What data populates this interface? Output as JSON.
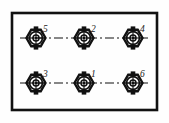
{
  "figure": {
    "type": "engineering-drawing",
    "background_color": "#fefefe",
    "line_color": "#111111",
    "frame": {
      "x": 12,
      "y": 13,
      "width": 145,
      "height": 97,
      "stroke_width": 2.6
    },
    "centerlines": {
      "style": "dash-dot",
      "rows_y": [
        38,
        83
      ],
      "x_start": 20,
      "x_end": 150
    },
    "symbol": {
      "name": "bolt-head-symbol",
      "outer_shape": "hexagon",
      "outer_radius": 9.5,
      "circle_radii": [
        6.5,
        3.2,
        1.4
      ],
      "tab_width": 4.5,
      "tab_height": 2.6
    },
    "bolts": [
      {
        "id": "bolt-5",
        "label": "5",
        "cx": 36,
        "cy": 38,
        "label_dx": 7,
        "label_dy": -6
      },
      {
        "id": "bolt-2",
        "label": "2",
        "cx": 84,
        "cy": 38,
        "label_dx": 7,
        "label_dy": -6
      },
      {
        "id": "bolt-4",
        "label": "4",
        "cx": 133,
        "cy": 38,
        "label_dx": 7,
        "label_dy": -6
      },
      {
        "id": "bolt-3",
        "label": "3",
        "cx": 36,
        "cy": 83,
        "label_dx": 7,
        "label_dy": -6
      },
      {
        "id": "bolt-1",
        "label": "1",
        "cx": 84,
        "cy": 83,
        "label_dx": 7,
        "label_dy": -6
      },
      {
        "id": "bolt-6",
        "label": "6",
        "cx": 133,
        "cy": 83,
        "label_dx": 7,
        "label_dy": -6
      }
    ]
  }
}
